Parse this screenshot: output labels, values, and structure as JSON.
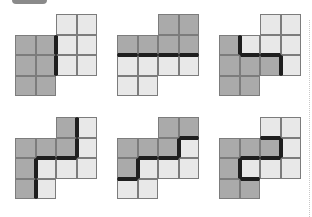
{
  "colors": {
    "dark": "#aaaaaa",
    "light": "#e8e8e8",
    "grid": "#7c7c7c",
    "boundary": "#1e1e1e"
  },
  "figures": [
    {
      "id": "fig-1",
      "x": 15,
      "y": 14,
      "dark": [
        [
          1,
          0
        ],
        [
          1,
          1
        ],
        [
          2,
          0
        ],
        [
          2,
          1
        ],
        [
          3,
          0
        ],
        [
          3,
          1
        ]
      ],
      "light": [
        [
          0,
          2
        ],
        [
          0,
          3
        ],
        [
          1,
          2
        ],
        [
          1,
          3
        ],
        [
          2,
          2
        ],
        [
          2,
          3
        ]
      ]
    },
    {
      "id": "fig-2",
      "x": 117,
      "y": 14,
      "dark": [
        [
          0,
          2
        ],
        [
          0,
          3
        ],
        [
          1,
          0
        ],
        [
          1,
          1
        ],
        [
          1,
          2
        ],
        [
          1,
          3
        ]
      ],
      "light": [
        [
          2,
          0
        ],
        [
          2,
          1
        ],
        [
          2,
          2
        ],
        [
          2,
          3
        ],
        [
          3,
          0
        ],
        [
          3,
          1
        ]
      ]
    },
    {
      "id": "fig-3",
      "x": 219,
      "y": 14,
      "dark": [
        [
          1,
          0
        ],
        [
          2,
          0
        ],
        [
          2,
          1
        ],
        [
          2,
          2
        ],
        [
          3,
          0
        ],
        [
          3,
          1
        ]
      ],
      "light": [
        [
          0,
          2
        ],
        [
          0,
          3
        ],
        [
          1,
          1
        ],
        [
          1,
          2
        ],
        [
          1,
          3
        ],
        [
          2,
          3
        ]
      ]
    },
    {
      "id": "fig-4",
      "x": 15,
      "y": 117,
      "dark": [
        [
          0,
          2
        ],
        [
          1,
          0
        ],
        [
          1,
          1
        ],
        [
          1,
          2
        ],
        [
          2,
          0
        ],
        [
          3,
          0
        ]
      ],
      "light": [
        [
          0,
          3
        ],
        [
          1,
          3
        ],
        [
          2,
          1
        ],
        [
          2,
          2
        ],
        [
          2,
          3
        ],
        [
          3,
          1
        ]
      ]
    },
    {
      "id": "fig-5",
      "x": 117,
      "y": 117,
      "dark": [
        [
          0,
          2
        ],
        [
          0,
          3
        ],
        [
          1,
          0
        ],
        [
          1,
          1
        ],
        [
          1,
          2
        ],
        [
          2,
          0
        ]
      ],
      "light": [
        [
          1,
          3
        ],
        [
          2,
          1
        ],
        [
          2,
          2
        ],
        [
          2,
          3
        ],
        [
          3,
          0
        ],
        [
          3,
          1
        ]
      ]
    },
    {
      "id": "fig-6",
      "x": 219,
      "y": 117,
      "dark": [
        [
          1,
          0
        ],
        [
          1,
          1
        ],
        [
          1,
          2
        ],
        [
          2,
          0
        ],
        [
          3,
          0
        ],
        [
          3,
          1
        ]
      ],
      "light": [
        [
          0,
          2
        ],
        [
          0,
          3
        ],
        [
          1,
          3
        ],
        [
          2,
          1
        ],
        [
          2,
          2
        ],
        [
          2,
          3
        ]
      ]
    }
  ]
}
